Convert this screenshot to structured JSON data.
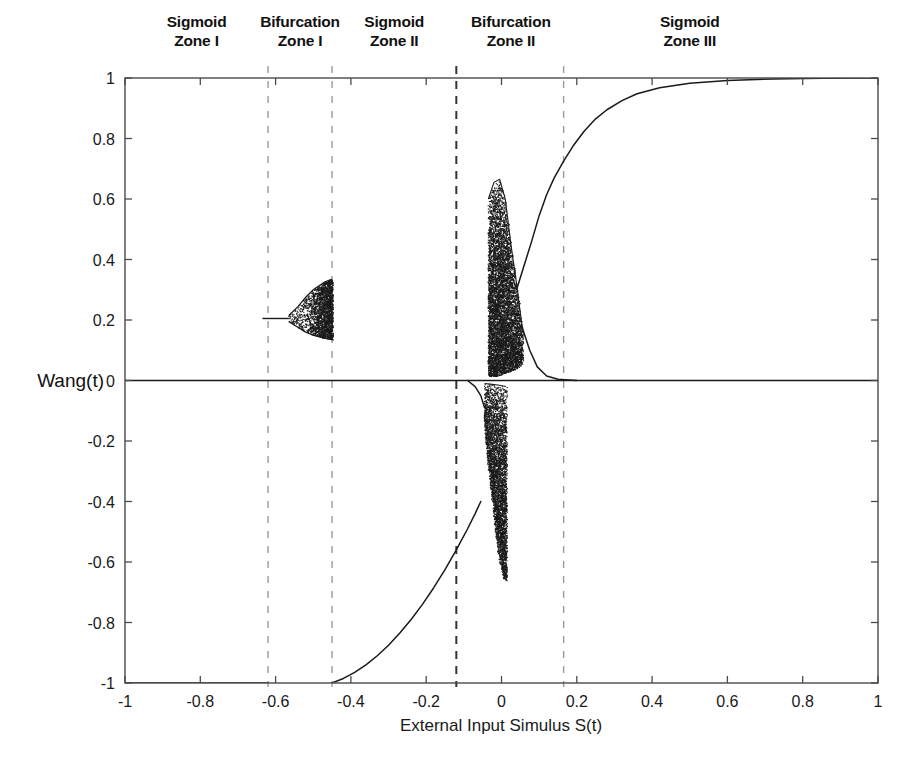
{
  "figure": {
    "background_color": "#ffffff",
    "ink_color": "#1a1a1a",
    "divider_color": "#9a9a9a",
    "divider_strong_color": "#333333"
  },
  "zones": [
    {
      "name": "sigmoid-zone-1",
      "line1": "Sigmoid",
      "line2": "Zone I",
      "center_s": -0.81
    },
    {
      "name": "bifurcation-zone-1",
      "line1": "Bifurcation",
      "line2": "Zone I",
      "center_s": -0.535
    },
    {
      "name": "sigmoid-zone-2",
      "line1": "Sigmoid",
      "line2": "Zone II",
      "center_s": -0.285
    },
    {
      "name": "bifurcation-zone-2",
      "line1": "Bifurcation",
      "line2": "Zone II",
      "center_s": 0.025
    },
    {
      "name": "sigmoid-zone-3",
      "line1": "Sigmoid",
      "line2": "Zone III",
      "center_s": 0.5
    }
  ],
  "chart_data": {
    "type": "scatter",
    "title": "",
    "xlabel": "External Input Simulus S(t)",
    "ylabel": "Wang(t)",
    "xlim": [
      -1,
      1
    ],
    "ylim": [
      -1,
      1
    ],
    "grid": false,
    "legend": "none",
    "xticks": [
      -1,
      -0.8,
      -0.6,
      -0.4,
      -0.2,
      0,
      0.2,
      0.4,
      0.6,
      0.8,
      1
    ],
    "xticklabels": [
      "-1",
      "-0.8",
      "-0.6",
      "-0.4",
      "-0.2",
      "0",
      "0.2",
      "0.4",
      "0.6",
      "0.8",
      "1"
    ],
    "yticks": [
      -1,
      -0.8,
      -0.6,
      -0.4,
      -0.2,
      0,
      0.2,
      0.4,
      0.6,
      0.8,
      1
    ],
    "yticklabels": [
      "-1",
      "-0.8",
      "-0.6",
      "-0.4",
      "-0.2",
      "0",
      "0.2",
      "0.4",
      "0.6",
      "0.8",
      "1"
    ],
    "zone_boundaries": [
      -0.62,
      -0.45,
      -0.12,
      0.165
    ],
    "zone_boundary_styles": [
      "dashed-light",
      "dashed-light",
      "dashed-dark",
      "dashed-light"
    ],
    "branches": [
      {
        "name": "fixed-point-zero",
        "kind": "line",
        "comment": "Horizontal zero branch spanning the full S range",
        "points": [
          [
            -1,
            0
          ],
          [
            1,
            0
          ]
        ]
      },
      {
        "name": "lower-saturated-branch",
        "kind": "line",
        "comment": "Flat branch at Wang=-1 for S from -1 to -0.62",
        "points": [
          [
            -1,
            -1
          ],
          [
            -0.62,
            -1
          ]
        ]
      },
      {
        "name": "lower-sigmoid-rise",
        "kind": "line",
        "comment": "Sigmoid ascending branch from -1 at S=-0.45 up through chaos onset",
        "points": [
          [
            -0.45,
            -1.0
          ],
          [
            -0.42,
            -0.985
          ],
          [
            -0.39,
            -0.965
          ],
          [
            -0.36,
            -0.94
          ],
          [
            -0.33,
            -0.91
          ],
          [
            -0.3,
            -0.875
          ],
          [
            -0.27,
            -0.835
          ],
          [
            -0.24,
            -0.79
          ],
          [
            -0.21,
            -0.74
          ],
          [
            -0.18,
            -0.685
          ],
          [
            -0.15,
            -0.625
          ],
          [
            -0.12,
            -0.56
          ],
          [
            -0.09,
            -0.49
          ],
          [
            -0.07,
            -0.44
          ],
          [
            -0.055,
            -0.4
          ]
        ]
      },
      {
        "name": "upper-sigmoid-rise",
        "kind": "line",
        "comment": "Sigmoid ascending branch exiting chaos and saturating at +1",
        "points": [
          [
            0.04,
            0.3
          ],
          [
            0.06,
            0.38
          ],
          [
            0.08,
            0.46
          ],
          [
            0.1,
            0.545
          ],
          [
            0.12,
            0.615
          ],
          [
            0.14,
            0.67
          ],
          [
            0.165,
            0.725
          ],
          [
            0.19,
            0.775
          ],
          [
            0.22,
            0.825
          ],
          [
            0.25,
            0.865
          ],
          [
            0.28,
            0.895
          ],
          [
            0.32,
            0.925
          ],
          [
            0.36,
            0.948
          ],
          [
            0.42,
            0.968
          ],
          [
            0.5,
            0.983
          ],
          [
            0.6,
            0.992
          ],
          [
            0.72,
            0.997
          ],
          [
            0.85,
            0.999
          ],
          [
            1.0,
            1.0
          ]
        ]
      },
      {
        "name": "upper-chaos-band",
        "kind": "chaos-band",
        "comment": "Dense chaotic attractor above zero, S in [-0.035, 0.055]",
        "s_start": -0.035,
        "s_end": 0.055,
        "top_envelope": [
          [
            -0.035,
            0.6
          ],
          [
            -0.02,
            0.655
          ],
          [
            -0.005,
            0.665
          ],
          [
            0.01,
            0.6
          ],
          [
            0.025,
            0.45
          ],
          [
            0.04,
            0.32
          ],
          [
            0.055,
            0.175
          ]
        ],
        "bottom_envelope": [
          [
            -0.035,
            0.015
          ],
          [
            -0.015,
            0.015
          ],
          [
            0.0,
            0.02
          ],
          [
            0.02,
            0.03
          ],
          [
            0.04,
            0.04
          ],
          [
            0.055,
            0.055
          ]
        ]
      },
      {
        "name": "lower-chaos-band",
        "kind": "chaos-band",
        "comment": "Dense chaotic attractor below zero, S in [-0.045, 0.01]",
        "s_start": -0.045,
        "s_end": 0.012,
        "top_envelope": [
          [
            -0.045,
            -0.01
          ],
          [
            -0.03,
            -0.012
          ],
          [
            -0.01,
            -0.015
          ],
          [
            0.012,
            -0.02
          ]
        ],
        "bottom_envelope": [
          [
            -0.045,
            -0.17
          ],
          [
            -0.035,
            -0.29
          ],
          [
            -0.025,
            -0.4
          ],
          [
            -0.015,
            -0.52
          ],
          [
            -0.005,
            -0.6
          ],
          [
            0.005,
            -0.655
          ],
          [
            0.012,
            -0.66
          ]
        ]
      },
      {
        "name": "bifurcation-wedge-zone1",
        "kind": "period-doubling-wedge",
        "comment": "Period-doubling cascade: single branch at 0.20 splits near S=-0.565 into filled chaotic wedge up to S=-0.45",
        "s_onset": -0.6,
        "s_split": -0.565,
        "s_end": -0.45,
        "base_value": 0.205,
        "upper_envelope": [
          [
            -0.565,
            0.215
          ],
          [
            -0.54,
            0.245
          ],
          [
            -0.52,
            0.275
          ],
          [
            -0.5,
            0.3
          ],
          [
            -0.47,
            0.325
          ],
          [
            -0.45,
            0.335
          ]
        ],
        "lower_envelope": [
          [
            -0.565,
            0.195
          ],
          [
            -0.54,
            0.175
          ],
          [
            -0.52,
            0.16
          ],
          [
            -0.5,
            0.15
          ],
          [
            -0.47,
            0.14
          ],
          [
            -0.45,
            0.135
          ]
        ]
      },
      {
        "name": "upper-return-to-zero",
        "kind": "line",
        "comment": "Short branch descending from chaos band back to the zero line just right of S=0.06",
        "points": [
          [
            0.055,
            0.175
          ],
          [
            0.075,
            0.1
          ],
          [
            0.095,
            0.045
          ],
          [
            0.12,
            0.015
          ],
          [
            0.15,
            0.004
          ],
          [
            0.2,
            0.0
          ]
        ]
      },
      {
        "name": "lower-entry-to-chaos",
        "kind": "line",
        "comment": "Short branch descending from the zero line into the lower chaos band",
        "points": [
          [
            -0.09,
            0.0
          ],
          [
            -0.07,
            -0.02
          ],
          [
            -0.055,
            -0.05
          ],
          [
            -0.045,
            -0.09
          ]
        ]
      }
    ]
  }
}
